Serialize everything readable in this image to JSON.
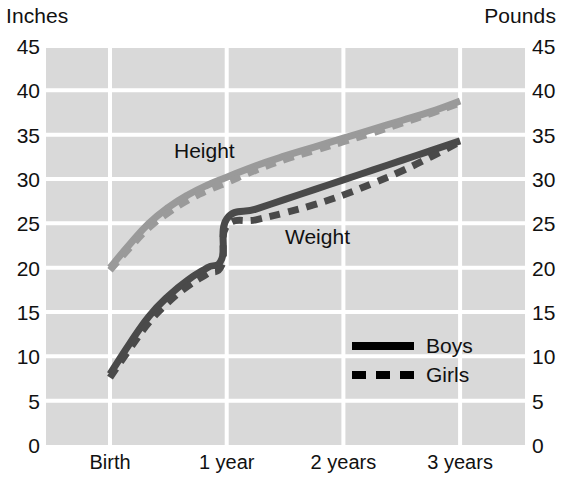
{
  "chart_data": {
    "type": "line",
    "title": "",
    "subtitle": "",
    "left_axis_title": "Inches",
    "right_axis_title": "Pounds",
    "xlabel": "",
    "ylabel": "",
    "ylim": [
      0,
      45
    ],
    "y_ticks": [
      45,
      40,
      35,
      30,
      25,
      20,
      15,
      10,
      5,
      0
    ],
    "x_tick_labels": [
      "Birth",
      "1 year",
      "2 years",
      "3 years"
    ],
    "x_tick_values": [
      0,
      12,
      24,
      36
    ],
    "grid": true,
    "legend_position": "inside-lower-right",
    "legend": [
      {
        "name": "Boys",
        "style": "solid"
      },
      {
        "name": "Girls",
        "style": "dashed"
      }
    ],
    "annotations": [
      {
        "text": "Height",
        "x_months": 7.5,
        "y": 33.5
      },
      {
        "text": "Weight",
        "x_months": 19.5,
        "y": 24.0
      }
    ],
    "colors": {
      "height": "#9a9a9a",
      "weight": "#4a4a4a",
      "legend": "#000000",
      "plot_background": "#d9d9d9",
      "gridline": "#ffffff",
      "text": "#111111",
      "page_background": "#ffffff"
    },
    "series": [
      {
        "name": "Height - Boys",
        "measure": "Height",
        "unit": "inches",
        "sex": "Boys",
        "style": "solid",
        "color": "#9a9a9a",
        "x_months": [
          0,
          2,
          4,
          6,
          8,
          10,
          12,
          15,
          18,
          21,
          24,
          27,
          30,
          33,
          36
        ],
        "values": [
          20.0,
          22.6,
          25.0,
          26.8,
          28.2,
          29.3,
          30.2,
          31.5,
          32.6,
          33.6,
          34.6,
          35.6,
          36.6,
          37.6,
          38.8
        ]
      },
      {
        "name": "Height - Girls",
        "measure": "Height",
        "unit": "inches",
        "sex": "Girls",
        "style": "dashed",
        "color": "#9a9a9a",
        "x_months": [
          0,
          2,
          4,
          6,
          8,
          10,
          12,
          15,
          18,
          21,
          24,
          27,
          30,
          33,
          36
        ],
        "values": [
          19.7,
          22.2,
          24.5,
          26.2,
          27.6,
          28.7,
          29.6,
          31.0,
          32.2,
          33.2,
          34.2,
          35.2,
          36.3,
          37.4,
          38.6
        ]
      },
      {
        "name": "Weight - Boys",
        "measure": "Weight",
        "unit": "pounds",
        "sex": "Boys",
        "style": "solid",
        "color": "#4a4a4a",
        "x_months": [
          0,
          2,
          4,
          6,
          8,
          10,
          11.5,
          12,
          15,
          18,
          21,
          24,
          27,
          30,
          33,
          36
        ],
        "values": [
          8.0,
          11.4,
          14.5,
          16.8,
          18.6,
          20.0,
          21.0,
          25.5,
          26.6,
          27.7,
          28.8,
          29.9,
          31.0,
          32.1,
          33.2,
          34.3
        ]
      },
      {
        "name": "Weight - Girls",
        "measure": "Weight",
        "unit": "pounds",
        "sex": "Girls",
        "style": "dashed",
        "color": "#4a4a4a",
        "x_months": [
          0,
          2,
          4,
          6,
          8,
          10,
          11.5,
          12,
          15,
          18,
          21,
          24,
          27,
          30,
          33,
          36
        ],
        "values": [
          7.6,
          10.8,
          13.8,
          16.1,
          17.9,
          19.3,
          20.3,
          24.7,
          25.4,
          26.2,
          27.1,
          28.2,
          29.5,
          30.9,
          32.5,
          34.2
        ]
      }
    ]
  }
}
